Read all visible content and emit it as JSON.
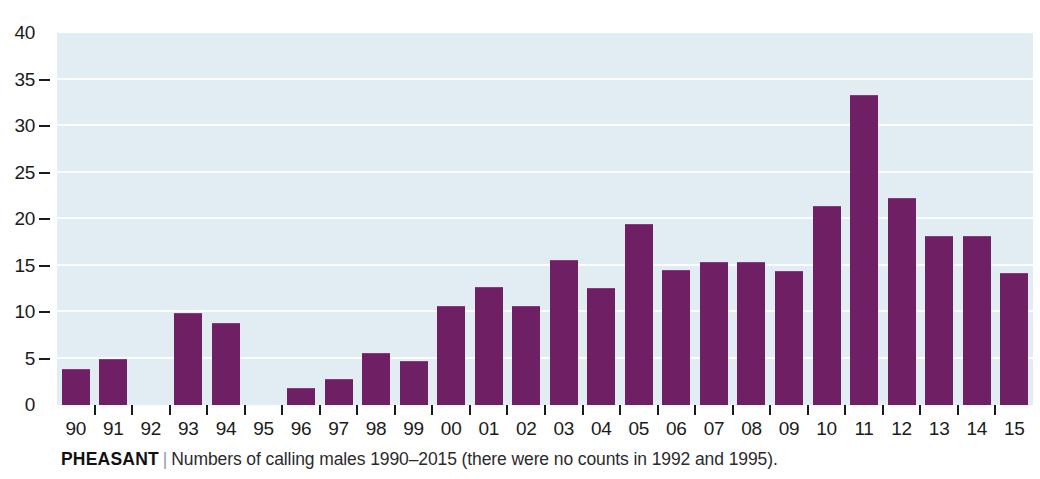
{
  "caption": {
    "species": "PHEASANT",
    "separator": "|",
    "description": "Numbers of calling males 1990–2015 (there were no counts in 1992 and 1995)."
  },
  "colors": {
    "bar": "#6f1f64",
    "plot_background": "#e2edf3",
    "gridline": "#fbfdfe",
    "axis_text": "#1b1b1b",
    "page_background": "#ffffff"
  },
  "chart_data": {
    "type": "bar",
    "title": "",
    "subtitle": "",
    "xlabel": "",
    "ylabel": "",
    "categories": [
      "90",
      "91",
      "92",
      "93",
      "94",
      "95",
      "96",
      "97",
      "98",
      "99",
      "00",
      "01",
      "02",
      "03",
      "04",
      "05",
      "06",
      "07",
      "08",
      "09",
      "10",
      "11",
      "12",
      "13",
      "14",
      "15"
    ],
    "full_years": [
      1990,
      1991,
      1992,
      1993,
      1994,
      1995,
      1996,
      1997,
      1998,
      1999,
      2000,
      2001,
      2002,
      2003,
      2004,
      2005,
      2006,
      2007,
      2008,
      2009,
      2010,
      2011,
      2012,
      2013,
      2014,
      2015
    ],
    "values": [
      3.9,
      4.9,
      null,
      9.9,
      8.8,
      null,
      1.8,
      2.8,
      5.6,
      4.7,
      10.7,
      12.7,
      10.6,
      15.6,
      12.6,
      19.5,
      14.5,
      15.4,
      15.4,
      14.4,
      21.4,
      33.3,
      22.3,
      18.2,
      18.2,
      14.2
    ],
    "missing_years": [
      1992,
      1995
    ],
    "ylim": [
      0,
      40
    ],
    "yticks": [
      0,
      5,
      10,
      15,
      20,
      25,
      30,
      35,
      40
    ],
    "ytick_labels": [
      "0",
      "5",
      "10",
      "15",
      "20",
      "25",
      "30",
      "35",
      "40"
    ],
    "grid": true,
    "grid_axis": "y",
    "legend": false,
    "legend_position": "none",
    "series": [
      {
        "name": "Calling males",
        "values": [
          3.9,
          4.9,
          null,
          9.9,
          8.8,
          null,
          1.8,
          2.8,
          5.6,
          4.7,
          10.7,
          12.7,
          10.6,
          15.6,
          12.6,
          19.5,
          14.5,
          15.4,
          15.4,
          14.4,
          21.4,
          33.3,
          22.3,
          18.2,
          18.2,
          14.2
        ]
      }
    ]
  }
}
